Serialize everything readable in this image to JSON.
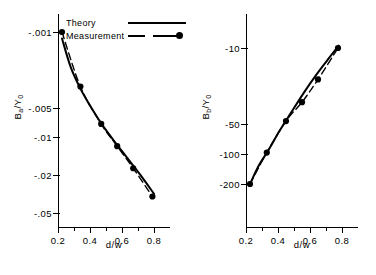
{
  "figure": {
    "panels": [
      {
        "id": "panel-a",
        "ylabel_main": "B",
        "ylabel_sub": "a",
        "ylabel_tail": "/Y",
        "ylabel_sub2": "0",
        "xlabel": "d/w",
        "yticks": [
          "-.001",
          "-.005",
          "-.01",
          "-.02",
          "-.05"
        ],
        "xticks": [
          "0.2",
          "0.4",
          "0.6",
          "0.8"
        ]
      },
      {
        "id": "panel-b",
        "ylabel_main": "B",
        "ylabel_sub": "b",
        "ylabel_tail": "/Y",
        "ylabel_sub2": "0",
        "xlabel": "d/w",
        "yticks": [
          "-10",
          "-50",
          "-100",
          "-200"
        ],
        "xticks": [
          "0.2",
          "0.4",
          "0.6",
          "0.8"
        ]
      }
    ],
    "legend": {
      "theory_label": "Theory",
      "measurement_label": "Measurement"
    }
  },
  "chart_data": [
    {
      "type": "line",
      "title": "",
      "xlabel": "d/w",
      "ylabel": "Ba/Y0",
      "yscale": "log-negative",
      "xlim": [
        0.2,
        0.85
      ],
      "ylim": [
        -0.001,
        -0.05
      ],
      "ytick_values": [
        -0.001,
        -0.005,
        -0.01,
        -0.02,
        -0.05
      ],
      "ytick_labels": [
        "-.001",
        "-.005",
        "-.01",
        "-.02",
        "-.05"
      ],
      "xtick_values": [
        0.2,
        0.4,
        0.6,
        0.8
      ],
      "xtick_labels": [
        "0.2",
        "0.4",
        "0.6",
        "0.8"
      ],
      "grid": false,
      "legend_position": "upper-center",
      "series": [
        {
          "name": "Theory",
          "style": "solid",
          "x": [
            0.225,
            0.28,
            0.34,
            0.4,
            0.47,
            0.55,
            0.63,
            0.71,
            0.8
          ],
          "y": [
            -0.00115,
            -0.00215,
            -0.0034,
            -0.0049,
            -0.0072,
            -0.0105,
            -0.015,
            -0.0215,
            -0.033
          ]
        },
        {
          "name": "Measurement",
          "style": "dashed",
          "markers": true,
          "x": [
            0.225,
            0.34,
            0.47,
            0.57,
            0.67,
            0.79
          ],
          "y": [
            -0.001,
            -0.00325,
            -0.0073,
            -0.0118,
            -0.019,
            -0.035
          ]
        }
      ]
    },
    {
      "type": "line",
      "title": "",
      "xlabel": "d/w",
      "ylabel": "Bb/Y0",
      "yscale": "log-negative",
      "xlim": [
        0.2,
        0.85
      ],
      "ylim": [
        -200,
        -8
      ],
      "ytick_values": [
        -10,
        -50,
        -100,
        -200
      ],
      "ytick_labels": [
        "-10",
        "-50",
        "-100",
        "-200"
      ],
      "xtick_values": [
        0.2,
        0.4,
        0.6,
        0.8
      ],
      "xtick_labels": [
        "0.2",
        "0.4",
        "0.6",
        "0.8"
      ],
      "grid": false,
      "legend_position": "none",
      "series": [
        {
          "name": "Theory",
          "style": "solid",
          "x": [
            0.225,
            0.28,
            0.34,
            0.41,
            0.48,
            0.56,
            0.64,
            0.71,
            0.78
          ],
          "y": [
            -200,
            -133,
            -95,
            -62,
            -42,
            -27,
            -18,
            -13,
            -9.5
          ]
        },
        {
          "name": "Measurement",
          "style": "dashed",
          "markers": true,
          "x": [
            0.225,
            0.33,
            0.45,
            0.55,
            0.65,
            0.775
          ],
          "y": [
            -200,
            -100,
            -50,
            -33,
            -20,
            -10
          ]
        }
      ]
    }
  ]
}
